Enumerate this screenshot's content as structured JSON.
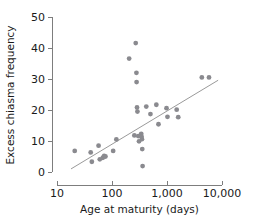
{
  "chart_data": {
    "type": "scatter",
    "title": "",
    "xlabel": "Age at maturity (days)",
    "ylabel": "Excess chiasma frequency",
    "xscale": "log",
    "yscale": "linear",
    "xlim": [
      10,
      10000
    ],
    "ylim": [
      0,
      50
    ],
    "xticks": [
      10,
      100,
      1000,
      10000
    ],
    "xticklabels": [
      "10",
      "100",
      "1,000",
      "10,000"
    ],
    "yticks": [
      0,
      10,
      20,
      30,
      40,
      50
    ],
    "yticklabels": [
      "0",
      "10",
      "20",
      "30",
      "40",
      "50"
    ],
    "grid": false,
    "legend": null,
    "marker_color": "#8a8a8f",
    "line_color": "#9a9a9a",
    "points": [
      {
        "x": 21,
        "y": 6.8
      },
      {
        "x": 41,
        "y": 6.3
      },
      {
        "x": 43,
        "y": 3.3
      },
      {
        "x": 57,
        "y": 8.5
      },
      {
        "x": 60,
        "y": 4.1
      },
      {
        "x": 68,
        "y": 4.6
      },
      {
        "x": 72,
        "y": 5.2
      },
      {
        "x": 76,
        "y": 5.0
      },
      {
        "x": 105,
        "y": 6.8
      },
      {
        "x": 120,
        "y": 10.5
      },
      {
        "x": 205,
        "y": 36.6
      },
      {
        "x": 255,
        "y": 11.8
      },
      {
        "x": 270,
        "y": 41.6
      },
      {
        "x": 278,
        "y": 32.0
      },
      {
        "x": 280,
        "y": 29.0
      },
      {
        "x": 285,
        "y": 20.8
      },
      {
        "x": 290,
        "y": 19.5
      },
      {
        "x": 300,
        "y": 11.6
      },
      {
        "x": 310,
        "y": 9.9
      },
      {
        "x": 340,
        "y": 12.3
      },
      {
        "x": 345,
        "y": 11.4
      },
      {
        "x": 350,
        "y": 10.6
      },
      {
        "x": 355,
        "y": 7.4
      },
      {
        "x": 360,
        "y": 1.9
      },
      {
        "x": 420,
        "y": 21.1
      },
      {
        "x": 500,
        "y": 18.7
      },
      {
        "x": 640,
        "y": 21.7
      },
      {
        "x": 700,
        "y": 15.4
      },
      {
        "x": 980,
        "y": 20.6
      },
      {
        "x": 1020,
        "y": 17.8
      },
      {
        "x": 1500,
        "y": 20.1
      },
      {
        "x": 1600,
        "y": 17.7
      },
      {
        "x": 4300,
        "y": 30.5
      },
      {
        "x": 5800,
        "y": 30.5
      }
    ],
    "fit_line": {
      "x_start": 18,
      "y_start": 1.0,
      "x_end": 8500,
      "y_end": 29.6
    }
  }
}
